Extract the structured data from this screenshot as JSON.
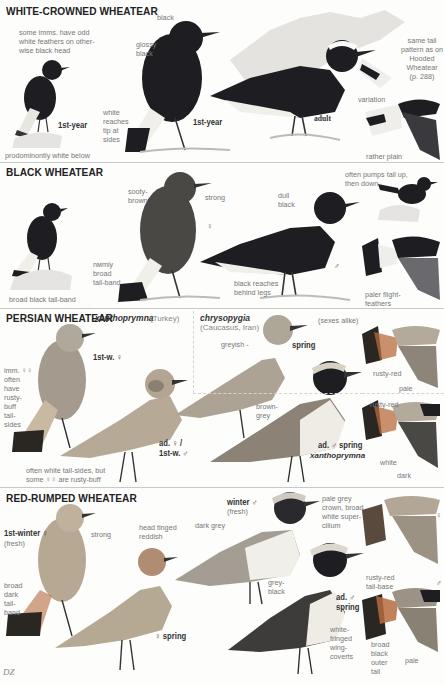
{
  "sections": [
    {
      "title": "WHITE-CROWNED WHEATEAR",
      "labels": {
        "imm_note": "some imms. have odd\nwhite feathers on other-\nwise black head",
        "black": "black",
        "glossy_black": "glossy\nblack",
        "white_reaches": "white\nreaches\ntip at\nsides",
        "predominantly_white": "prodominontly white below",
        "same_tail": "same tail\npattern as on\nHooded\nWheatear\n(p. 288)",
        "variation": "variation",
        "rather_plain": "rather plain"
      },
      "ages": {
        "small_1st_year": "1st-year",
        "big_1st_year": "1st-year",
        "adult": "adult"
      }
    },
    {
      "title": "BLACK WHEATEAR",
      "labels": {
        "sooty_brown": "sooty-\nbrown",
        "strong": "strong",
        "narrow_band": "nмmly\nbroad\ntail-band",
        "broad_black_band": "broad black tail-band",
        "dull_black": "dull\nblack",
        "black_reaches": "black reaches\nbehind legs",
        "pumps_tail": "often pumps tail up,\nthen down",
        "paler_flight": "paler flight-\nfeathers"
      },
      "ages": {
        "female": "♀",
        "male": "♂"
      }
    },
    {
      "title": "PERSIAN WHEATEAR",
      "subspecies_1": {
        "name": "xanthoprymna",
        "region": "(Turkey)"
      },
      "subspecies_2": {
        "name": "chrysopygia",
        "region": "(Caucasus, Iran)"
      },
      "labels": {
        "sexes_alike": "(sexes alike)",
        "imm_females": "imm. ♀♀\noften\nhave\nrusty-\nbuff\ntail-\nsides",
        "greyish": "greyish -",
        "brown_grey": "brown-\ngrey",
        "white_tail_sides": "often white tail-sides, but\nsome ♀♀ are rusty-buff",
        "rusty_red_1": "rusty-red",
        "pale": "pale",
        "rusty_red_2": "rusty-red",
        "white": "white",
        "dark": "dark"
      },
      "ages": {
        "first_w_female": "1st-w. ♀",
        "ad_female": "ad. ♀ /\n1st-w. ♂",
        "spring": "spring",
        "ad_male_spring": "ad. ♂ spring",
        "ad_male_spring_sci": "xanthoprymna"
      }
    },
    {
      "title": "RED-RUMPED WHEATEAR",
      "labels": {
        "strong": "strong",
        "head_tinged": "head tinged\nreddish",
        "broad_dark_band": "broad\ndark\ntail-\nband",
        "dark_grey": "dark grey",
        "pale_grey_crown": "pale grey\ncrown, broad\nwhite super-\ncilium",
        "grey_black": "grey-\nblack",
        "white_fringed": "white-\nfringed\nwing-\ncoverts",
        "rusty_red_base": "rusty-red\ntail-base",
        "broad_black_outer": "broad\nblack\nouter\ntail",
        "pale": "pale"
      },
      "ages": {
        "first_winter_female": "1st-winter ♀",
        "fresh_1": "(fresh)",
        "spring_female": "♀ spring",
        "winter_male": "winter ♂",
        "fresh_2": "(fresh)",
        "ad_male_spring": "ad. ♂\nspring",
        "female_symbol": "♀",
        "male_symbol": "♂"
      }
    }
  ],
  "signature": "DZ",
  "colors": {
    "black_bird": "#1e1e22",
    "sooty": "#4a4844",
    "grey_brown": "#9a9288",
    "buff": "#c9b9a1",
    "rusty": "#b56b3e",
    "white": "#f4f2ee",
    "rule": "#c9c9c9"
  }
}
